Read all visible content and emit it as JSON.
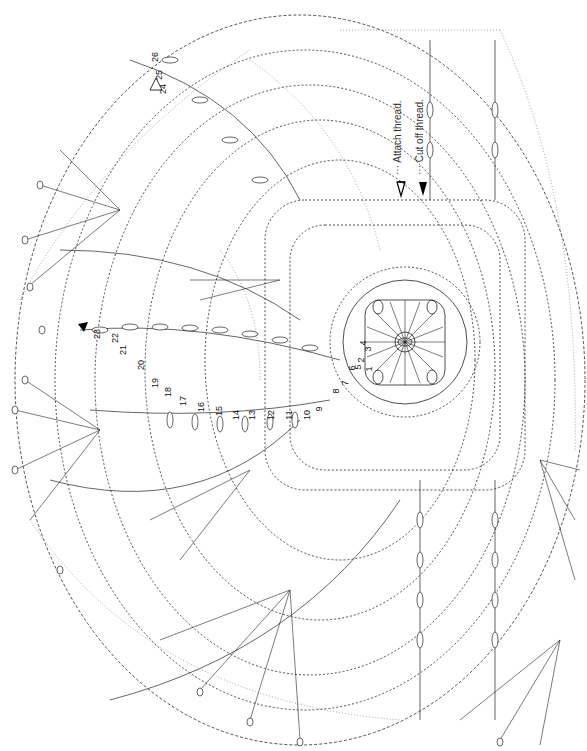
{
  "diagram": {
    "type": "crochet-chart",
    "orientation": "rotated 90deg",
    "legend": [
      {
        "symbol": "open-arrowhead",
        "label": "··· Attach thread."
      },
      {
        "symbol": "filled-arrowhead",
        "label": "··· Cut off thread."
      }
    ],
    "row_numbers": [
      {
        "n": "1",
        "x": 366,
        "y": 364
      },
      {
        "n": "2",
        "x": 358,
        "y": 355
      },
      {
        "n": "3",
        "x": 365,
        "y": 344
      },
      {
        "n": "4",
        "x": 360,
        "y": 338
      },
      {
        "n": "5",
        "x": 355,
        "y": 362
      },
      {
        "n": "6",
        "x": 349,
        "y": 363
      },
      {
        "n": "7",
        "x": 342,
        "y": 378
      },
      {
        "n": "8",
        "x": 333,
        "y": 386
      },
      {
        "n": "9",
        "x": 316,
        "y": 404
      },
      {
        "n": "10",
        "x": 302,
        "y": 410
      },
      {
        "n": "11",
        "x": 284,
        "y": 410
      },
      {
        "n": "12",
        "x": 266,
        "y": 410
      },
      {
        "n": "13",
        "x": 247,
        "y": 410
      },
      {
        "n": "14",
        "x": 231,
        "y": 410
      },
      {
        "n": "15",
        "x": 214,
        "y": 406
      },
      {
        "n": "16",
        "x": 196,
        "y": 402
      },
      {
        "n": "17",
        "x": 178,
        "y": 396
      },
      {
        "n": "18",
        "x": 163,
        "y": 387
      },
      {
        "n": "19",
        "x": 150,
        "y": 378
      },
      {
        "n": "20",
        "x": 136,
        "y": 360
      },
      {
        "n": "21",
        "x": 118,
        "y": 345
      },
      {
        "n": "22",
        "x": 110,
        "y": 333
      },
      {
        "n": "23",
        "x": 92,
        "y": 329
      },
      {
        "n": "24",
        "x": 158,
        "y": 84
      },
      {
        "n": "25",
        "x": 154,
        "y": 70
      },
      {
        "n": "26",
        "x": 150,
        "y": 52
      }
    ],
    "chain_count_labels": [
      "5",
      "7",
      "9",
      "11"
    ]
  }
}
